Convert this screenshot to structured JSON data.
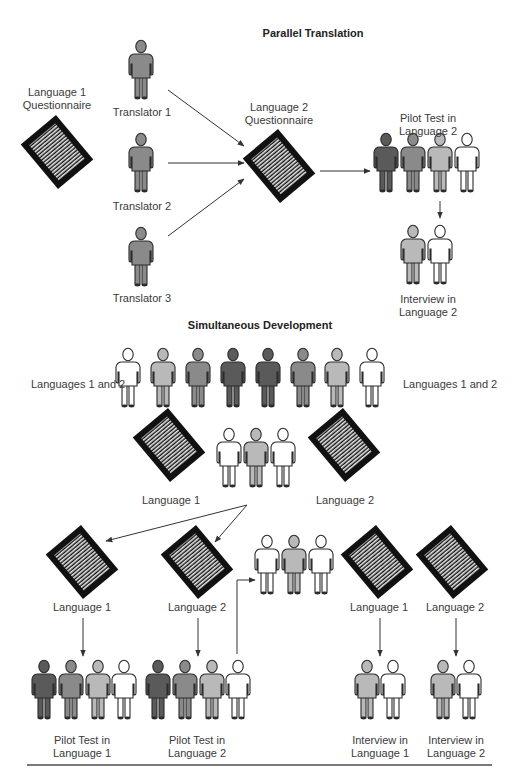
{
  "colors": {
    "dark": "#5a5a5a",
    "medium": "#8a8a8a",
    "light": "#b9b9b9",
    "white": "#ffffff",
    "outline": "#2b2b2b",
    "doc_frame": "#111111",
    "arrow": "#333333",
    "rule": "#7a7a7a"
  },
  "parallel": {
    "title": "Parallel Translation",
    "source_label": "Language 1\nQuestionnaire",
    "translators": [
      {
        "label": "Translator 1"
      },
      {
        "label": "Translator 2"
      },
      {
        "label": "Translator 3"
      }
    ],
    "target_label": "Language 2\nQuestionnaire",
    "pilot_label": "Pilot Test in Language 2",
    "interview_label": "Interview in Language 2"
  },
  "simultaneous": {
    "title": "Simultaneous Development",
    "team_label_left": "Languages 1 and 2",
    "team_label_right": "Languages 1 and 2",
    "doc1_label": "Language 1",
    "doc2_label": "Language 2",
    "split_doc1_label": "Language 1",
    "split_doc2_label": "Language 2",
    "final_doc1_label": "Language 1",
    "final_doc2_label": "Language 2",
    "pilot1_label": "Pilot Test in\nLanguage 1",
    "pilot2_label": "Pilot Test in\nLanguage 2",
    "interview1_label": "Interview in\nLanguage 1",
    "interview2_label": "Interview in\nLanguage 2"
  },
  "people": [
    {
      "id": "translator-1",
      "x": 141,
      "y": 40,
      "shade": "medium"
    },
    {
      "id": "translator-2",
      "x": 141,
      "y": 133,
      "shade": "medium"
    },
    {
      "id": "translator-3",
      "x": 141,
      "y": 227,
      "shade": "medium"
    },
    {
      "id": "pilot2-a",
      "x": 386,
      "y": 133,
      "shade": "dark"
    },
    {
      "id": "pilot2-b",
      "x": 413,
      "y": 133,
      "shade": "medium"
    },
    {
      "id": "pilot2-c",
      "x": 440,
      "y": 133,
      "shade": "light"
    },
    {
      "id": "pilot2-d",
      "x": 467,
      "y": 133,
      "shade": "white"
    },
    {
      "id": "interview2-a",
      "x": 413,
      "y": 225,
      "shade": "light"
    },
    {
      "id": "interview2-b",
      "x": 440,
      "y": 225,
      "shade": "white"
    },
    {
      "id": "team-1",
      "x": 128,
      "y": 348,
      "shade": "white"
    },
    {
      "id": "team-2",
      "x": 163,
      "y": 348,
      "shade": "light"
    },
    {
      "id": "team-3",
      "x": 198,
      "y": 348,
      "shade": "medium"
    },
    {
      "id": "team-4",
      "x": 233,
      "y": 348,
      "shade": "dark"
    },
    {
      "id": "team-5",
      "x": 268,
      "y": 348,
      "shade": "dark"
    },
    {
      "id": "team-6",
      "x": 303,
      "y": 348,
      "shade": "medium"
    },
    {
      "id": "team-7",
      "x": 337,
      "y": 348,
      "shade": "light"
    },
    {
      "id": "team-8",
      "x": 372,
      "y": 348,
      "shade": "white"
    },
    {
      "id": "reviewers-a",
      "x": 229,
      "y": 428,
      "shade": "white"
    },
    {
      "id": "reviewers-b",
      "x": 256,
      "y": 428,
      "shade": "light"
    },
    {
      "id": "reviewers-c",
      "x": 283,
      "y": 428,
      "shade": "white"
    },
    {
      "id": "reviewers2-a",
      "x": 267,
      "y": 535,
      "shade": "white"
    },
    {
      "id": "reviewers2-b",
      "x": 294,
      "y": 535,
      "shade": "light"
    },
    {
      "id": "reviewers2-c",
      "x": 321,
      "y": 535,
      "shade": "white"
    },
    {
      "id": "pilot1-a",
      "x": 44,
      "y": 660,
      "shade": "dark"
    },
    {
      "id": "pilot1-b",
      "x": 71,
      "y": 660,
      "shade": "medium"
    },
    {
      "id": "pilot1-c",
      "x": 98,
      "y": 660,
      "shade": "light"
    },
    {
      "id": "pilot1-d",
      "x": 124,
      "y": 660,
      "shade": "white"
    },
    {
      "id": "pilot2b-a",
      "x": 158,
      "y": 660,
      "shade": "dark"
    },
    {
      "id": "pilot2b-b",
      "x": 185,
      "y": 660,
      "shade": "medium"
    },
    {
      "id": "pilot2b-c",
      "x": 212,
      "y": 660,
      "shade": "light"
    },
    {
      "id": "pilot2b-d",
      "x": 238,
      "y": 660,
      "shade": "white"
    },
    {
      "id": "interview1-a",
      "x": 367,
      "y": 660,
      "shade": "light"
    },
    {
      "id": "interview1-b",
      "x": 393,
      "y": 660,
      "shade": "white"
    },
    {
      "id": "interview2b-a",
      "x": 443,
      "y": 660,
      "shade": "light"
    },
    {
      "id": "interview2b-b",
      "x": 469,
      "y": 660,
      "shade": "white"
    }
  ],
  "docs": [
    {
      "id": "parallel-source",
      "x": 57,
      "y": 152
    },
    {
      "id": "parallel-target",
      "x": 279,
      "y": 166
    },
    {
      "id": "sim-doc1",
      "x": 169,
      "y": 445
    },
    {
      "id": "sim-doc2",
      "x": 344,
      "y": 445
    },
    {
      "id": "split-doc1",
      "x": 82,
      "y": 562
    },
    {
      "id": "split-doc2",
      "x": 197,
      "y": 562
    },
    {
      "id": "final-doc1",
      "x": 377,
      "y": 562
    },
    {
      "id": "final-doc2",
      "x": 452,
      "y": 562
    }
  ],
  "arrows": [
    {
      "id": "t1-to-target",
      "x1": 168,
      "y1": 90,
      "x2": 244,
      "y2": 146
    },
    {
      "id": "t2-to-target",
      "x1": 168,
      "y1": 163,
      "x2": 244,
      "y2": 163
    },
    {
      "id": "t3-to-target",
      "x1": 168,
      "y1": 236,
      "x2": 244,
      "y2": 179
    },
    {
      "id": "target-to-pilot",
      "x1": 320,
      "y1": 171,
      "x2": 370,
      "y2": 171
    },
    {
      "id": "pilot-to-interview",
      "x1": 440,
      "y1": 201,
      "x2": 440,
      "y2": 218
    },
    {
      "id": "doc1-to-split1",
      "x1": 247,
      "y1": 505,
      "x2": 106,
      "y2": 541
    },
    {
      "id": "doc1-to-split2",
      "x1": 247,
      "y1": 505,
      "x2": 215,
      "y2": 542
    },
    {
      "id": "split1-to-pilot1",
      "x1": 83,
      "y1": 618,
      "x2": 83,
      "y2": 656
    },
    {
      "id": "split2-to-pilot2",
      "x1": 198,
      "y1": 618,
      "x2": 198,
      "y2": 656
    },
    {
      "id": "final1-to-interview1",
      "x1": 380,
      "y1": 618,
      "x2": 380,
      "y2": 656
    },
    {
      "id": "final2-to-interview2",
      "x1": 456,
      "y1": 618,
      "x2": 456,
      "y2": 656
    }
  ],
  "elbow_arrow": {
    "id": "pilot2-to-reviewers2",
    "points": "237,654 237,580 255,580"
  }
}
